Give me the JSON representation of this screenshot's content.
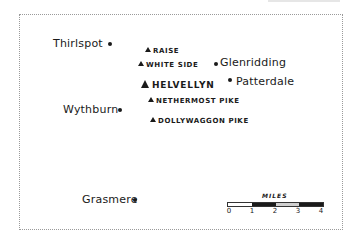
{
  "map": {
    "towns": [
      {
        "name": "Thirlspot"
      },
      {
        "name": "Wythburn"
      },
      {
        "name": "Grasmere"
      },
      {
        "name": "Glenridding"
      },
      {
        "name": "Patterdale"
      }
    ],
    "peaks": [
      {
        "name": "RAISE"
      },
      {
        "name": "WHITE SIDE"
      },
      {
        "name": "HELVELLYN"
      },
      {
        "name": "NETHERMOST PIKE"
      },
      {
        "name": "DOLLYWAGGON PIKE"
      }
    ],
    "scale": {
      "title": "MILES",
      "ticks": [
        "0",
        "1",
        "2",
        "3",
        "4"
      ],
      "segment_colors": [
        "#ffffff",
        "#1a1a1a",
        "#cfcfcf",
        "#1a1a1a"
      ]
    }
  }
}
